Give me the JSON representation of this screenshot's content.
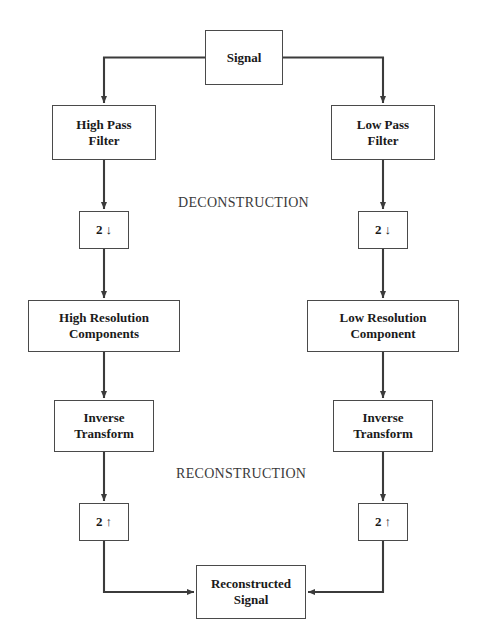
{
  "diagram": {
    "title_label_deconstruction": "DECONSTRUCTION",
    "title_label_reconstruction": "RECONSTRUCTION",
    "colors": {
      "stroke": "#4a4a4a",
      "text": "#1a1a1a",
      "label_text": "#3a3a3a",
      "background": "#ffffff"
    },
    "nodes": {
      "signal": "Signal",
      "high_pass_filter": "High Pass\nFilter",
      "low_pass_filter": "Low Pass\nFilter",
      "downsample_left_factor": "2",
      "downsample_left_arrow": "↓",
      "downsample_right_factor": "2",
      "downsample_right_arrow": "↓",
      "high_resolution_components": "High Resolution\nComponents",
      "low_resolution_component": "Low Resolution\nComponent",
      "inverse_transform_left": "Inverse\nTransform",
      "inverse_transform_right": "Inverse\nTransform",
      "upsample_left_factor": "2",
      "upsample_left_arrow": "↑",
      "upsample_right_factor": "2",
      "upsample_right_arrow": "↑",
      "reconstructed_signal": "Reconstructed\nSignal"
    }
  }
}
